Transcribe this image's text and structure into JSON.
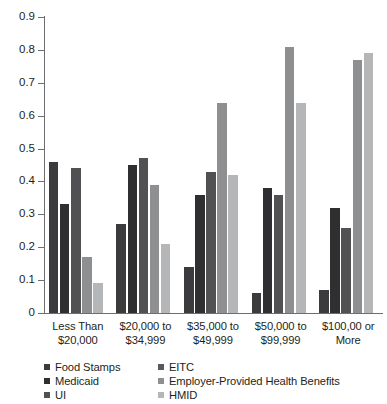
{
  "chart_data": {
    "type": "bar",
    "title": "",
    "subtitle": "",
    "xlabel": "",
    "ylabel": "",
    "ylim": [
      0,
      0.9
    ],
    "grid": false,
    "legend_position": "bottom",
    "categories": [
      "Less Than\n$20,000",
      "$20,000 to\n$34,999",
      "$35,000 to\n$49,999",
      "$50,000 to\n$99,999",
      "$100,00 or\nMore"
    ],
    "category_lines": [
      [
        "Less Than",
        "$20,000"
      ],
      [
        "$20,000 to",
        "$34,999"
      ],
      [
        "$35,000 to",
        "$49,999"
      ],
      [
        "$50,000 to",
        "$99,999"
      ],
      [
        "$100,00 or",
        "More"
      ]
    ],
    "ytick_labels": [
      "0.9",
      "0.8",
      "0.7",
      "0.6",
      "0.5",
      "0.4",
      "0.3",
      "0.2",
      "0.1",
      "0"
    ],
    "ytick_values": [
      0.9,
      0.8,
      0.7,
      0.6,
      0.5,
      0.4,
      0.3,
      0.2,
      0.1,
      0
    ],
    "series": [
      {
        "name": "Food Stamps",
        "color": "#3b3b3d",
        "values": [
          0.46,
          0.27,
          0.14,
          0.06,
          0.07
        ]
      },
      {
        "name": "Medicaid",
        "color": "#2f2f31",
        "values": [
          0.33,
          0.45,
          0.36,
          0.38,
          0.32
        ]
      },
      {
        "name": "UI",
        "color": "#515153",
        "values": [
          0.44,
          0.47,
          0.43,
          0.36,
          0.26
        ]
      },
      {
        "name": "EITC",
        "color": "#8e8f91",
        "values": [
          0.17,
          0.39,
          0.64,
          0.81,
          0.77
        ]
      },
      {
        "name": "Employer-Provided Health Benefits",
        "color": "#b5b6b8",
        "values": [
          0.09,
          0.21,
          0.42,
          0.64,
          0.79
        ]
      }
    ],
    "legend_entries": [
      {
        "label": "Food Stamps",
        "color": "#3b3b3d",
        "column": "left"
      },
      {
        "label": "Medicaid",
        "color": "#2f2f31",
        "column": "left"
      },
      {
        "label": "UI",
        "color": "#515153",
        "column": "left"
      },
      {
        "label": "EITC",
        "color": "#58595b",
        "column": "right"
      },
      {
        "label": "Employer-Provided Health Benefits",
        "color": "#8e8f91",
        "column": "right"
      },
      {
        "label": "HMID",
        "color": "#b5b6b8",
        "column": "right"
      }
    ],
    "axis_color": "#6d6e71",
    "text_color": "#231f20",
    "background": "#ffffff"
  }
}
